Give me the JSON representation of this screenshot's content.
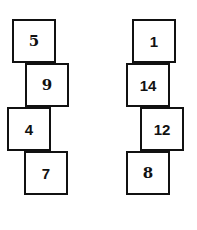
{
  "left_stack": {
    "boxes": [
      {
        "value": "5",
        "x": 12,
        "y": 19
      },
      {
        "value": "9",
        "x": 25,
        "y": 63
      },
      {
        "value": "4",
        "x": 7,
        "y": 107
      },
      {
        "value": "7",
        "x": 24,
        "y": 151
      }
    ]
  },
  "right_stack": {
    "boxes": [
      {
        "value": "1",
        "x": 132,
        "y": 19
      },
      {
        "value": "14",
        "x": 126,
        "y": 63
      },
      {
        "value": "12",
        "x": 140,
        "y": 107
      },
      {
        "value": "8",
        "x": 126,
        "y": 151
      }
    ]
  }
}
